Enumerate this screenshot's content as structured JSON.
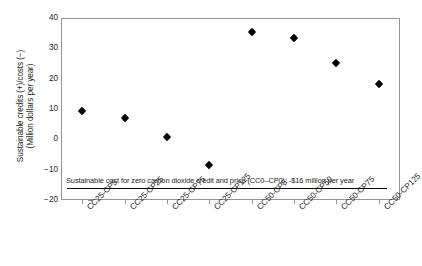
{
  "chart_data": {
    "type": "scatter",
    "title": "",
    "xlabel": "",
    "ylabel": "Sustainable credits (+)/costs (−) (Million dollars per year)",
    "ylabel_line1": "Sustainable credits (+)/costs (−)",
    "ylabel_line2": "(Million dollars per year)",
    "categories": [
      "CC25-CP5",
      "CC25-CP25",
      "CC25-CP75",
      "CC25-CP125",
      "CC50-CP5",
      "CC50-CP50",
      "CC50-CP75",
      "CC50-CP125"
    ],
    "values": [
      9.5,
      7.0,
      0.8,
      -8.5,
      35.5,
      33.5,
      25.3,
      18.3
    ],
    "ylim": [
      -20,
      40
    ],
    "yticks": [
      40,
      30,
      20,
      10,
      0,
      -10,
      -20
    ],
    "ytick_labels": [
      "40",
      "30",
      "20",
      "10",
      "0",
      "−10",
      "−20"
    ],
    "grid": false,
    "legend": "none",
    "marker": "diamond",
    "marker_color": "#000000",
    "annotations": [
      {
        "text": "Sustainable cost for zero carbon dioxide credit and price (CC0–CP0): -$16 million per year",
        "value": -16,
        "rule": true
      }
    ]
  },
  "colors": {
    "axis": "#939598",
    "text": "#231f20",
    "marker": "#000000",
    "rule": "#000000",
    "background": "#ffffff"
  }
}
